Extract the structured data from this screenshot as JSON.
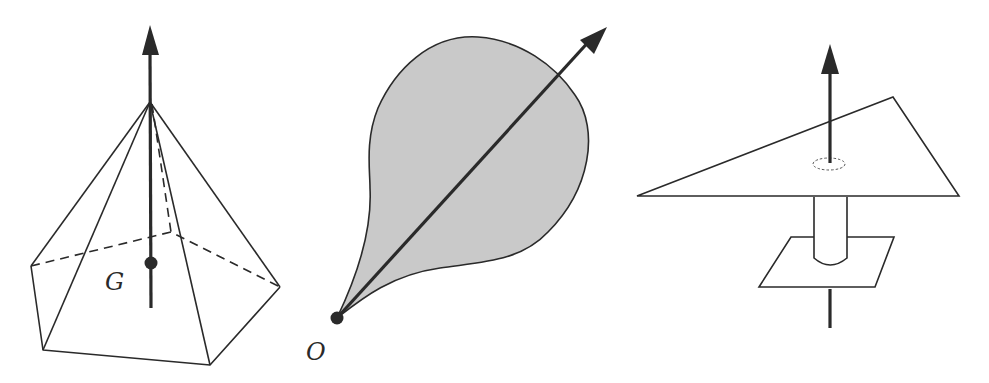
{
  "figure": {
    "panels": [
      {
        "id": "pyramid",
        "description": "Pentagonal pyramid with vertical axis arrow through apex and centroid",
        "point_label": "G"
      },
      {
        "id": "drop-lamina",
        "description": "Shaded drop-shaped lamina with axis arrow from point O",
        "point_label": "O"
      },
      {
        "id": "plane-axis",
        "description": "Triangular plate with perpendicular axis passing through a hole and a lower parallelogram plate",
        "point_label": ""
      }
    ],
    "colors": {
      "stroke": "#2a2a2a",
      "fill_shaded": "#c9c9c9",
      "background": "#ffffff"
    }
  }
}
